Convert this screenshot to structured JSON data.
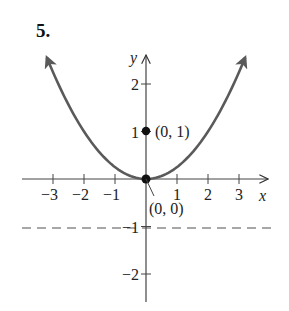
{
  "problem_number": "5.",
  "chart_data": {
    "type": "line",
    "title": "",
    "xlabel": "x",
    "ylabel": "y",
    "xlim": [
      -4,
      4
    ],
    "ylim": [
      -2.6,
      2.8
    ],
    "grid": false,
    "x_ticks": [
      -3,
      -2,
      -1,
      1,
      2,
      3
    ],
    "y_ticks": [
      -2,
      -1,
      1,
      2
    ],
    "x_tick_labels": [
      "−3",
      "−2",
      "−1",
      "1",
      "2",
      "3"
    ],
    "y_tick_labels": [
      "−2",
      "−1",
      "1",
      "2"
    ],
    "series": [
      {
        "name": "parabola y = x^2/4",
        "style": "solid",
        "color": "#5a5a5a",
        "arrows_both_ends": true,
        "x": [
          -3.2,
          -3,
          -2,
          -1,
          0,
          1,
          2,
          3,
          3.2
        ],
        "y": [
          2.56,
          2.25,
          1,
          0.25,
          0,
          0.25,
          1,
          2.25,
          2.56
        ]
      },
      {
        "name": "directrix y = -1",
        "style": "dashed",
        "color": "#8a8a8a",
        "x": [
          -4,
          4
        ],
        "y": [
          -1,
          -1
        ]
      }
    ],
    "points": [
      {
        "label": "(0, 1)",
        "x": 0,
        "y": 1
      },
      {
        "label": "(0, 0)",
        "x": 0,
        "y": 0
      }
    ],
    "annotations": [
      "(0, 1)",
      "(0, 0)"
    ]
  }
}
